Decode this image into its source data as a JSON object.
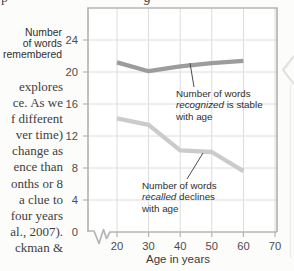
{
  "page": {
    "top_fragments": [
      "p",
      "g"
    ],
    "left_column_lines": [
      "explores",
      "ce. As we",
      "f different",
      "ver time)",
      "change as",
      "ence than",
      "onths or 8",
      "a clue to",
      "four years",
      "al., 2007).",
      "ckman &"
    ]
  },
  "chart_data": {
    "type": "line",
    "x": [
      20,
      30,
      40,
      50,
      60
    ],
    "x_ticks": [
      20,
      30,
      40,
      50,
      60,
      70
    ],
    "y_ticks": [
      0,
      4,
      8,
      12,
      16,
      20,
      24
    ],
    "xlabel": "Age in years",
    "ylabel_lines": [
      "Number",
      "of words",
      "remembered"
    ],
    "ylabel": "Number of words remembered",
    "xlim": [
      20,
      70
    ],
    "ylim": [
      0,
      28
    ],
    "x_axis_break": true,
    "grid": true,
    "series": [
      {
        "name": "recognized",
        "color": "#9c9c9c",
        "values": [
          21.2,
          20.1,
          20.7,
          21.1,
          21.4
        ]
      },
      {
        "name": "recalled",
        "color": "#cbcbcb",
        "values": [
          14.2,
          13.4,
          10.2,
          10.0,
          7.6
        ]
      }
    ],
    "annotations": [
      {
        "line1": "Number of words",
        "italic": "recognized",
        "rest": " is stable",
        "line3": "with age"
      },
      {
        "line1": "Number of words",
        "italic": "recalled",
        "rest": " declines",
        "line3": "with age"
      }
    ]
  },
  "colors": {
    "grid": "#dcdcdc",
    "border": "#b5b5b5",
    "tick_text": "#4d4d4d",
    "leader": "#4a4a4a",
    "page_edge": "#e2e2e0",
    "page_edge_line": "#ededeb"
  }
}
